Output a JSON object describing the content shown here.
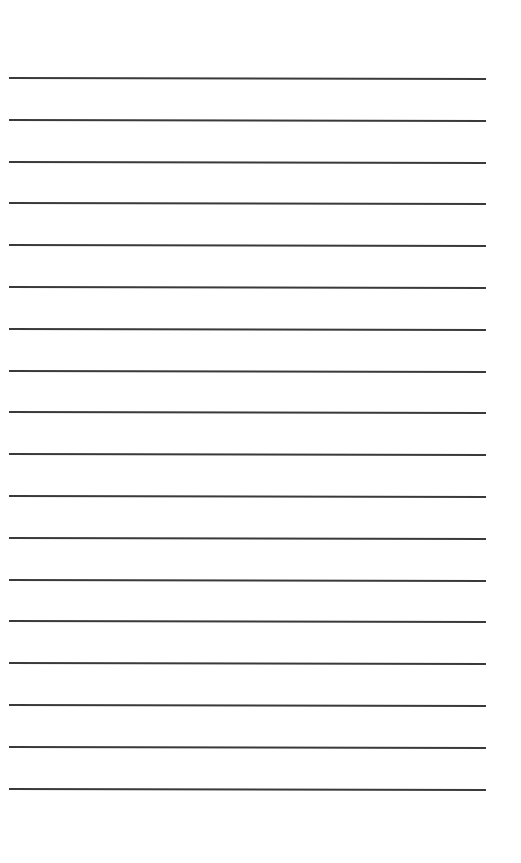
{
  "page": {
    "type": "lined-paper",
    "background": "#ffffff",
    "line_color": "#3a3a3a",
    "line_count": 18,
    "first_line_y": 77,
    "line_spacing": 41.8
  }
}
